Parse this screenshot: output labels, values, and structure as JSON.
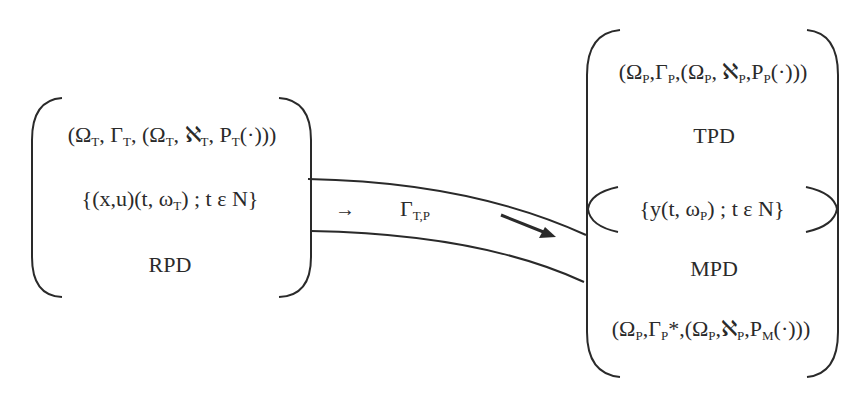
{
  "left_box": {
    "name": "RPD",
    "tuple": {
      "omega": "Ω",
      "omega_sub": "T",
      "gamma": "Γ",
      "gamma_sub": "T",
      "aleph": "ℵ",
      "aleph_sub": "T",
      "p": "P",
      "p_sub": "T"
    },
    "process": {
      "xu": "{(x,u)(t, ω",
      "omega_sub": "T",
      "rest": ") ; t ε N}"
    },
    "label": "RPD"
  },
  "right_box": {
    "top_tuple": {
      "omega": "Ω",
      "omega_sub": "P",
      "gamma": "Γ",
      "gamma_sub": "P",
      "aleph": "ℵ",
      "aleph_sub": "P",
      "p": "P",
      "p_sub": "P"
    },
    "top_label": "TPD",
    "process": {
      "prefix": "{y(t, ω",
      "omega_sub": "P",
      "rest": ") ; t ε N}"
    },
    "bottom_label": "MPD",
    "bottom_tuple": {
      "omega": "Ω",
      "omega_sub": "P",
      "gamma": "Γ",
      "gamma_sub": "P",
      "star": "*",
      "aleph": "ℵ",
      "aleph_sub": "P",
      "p": "P",
      "p_sub": "M"
    }
  },
  "channel": {
    "arrow_glyph": "→",
    "gamma": "Γ",
    "gamma_sub": "T,P"
  },
  "colors": {
    "stroke": "#2a2a2a",
    "background": "#ffffff"
  }
}
